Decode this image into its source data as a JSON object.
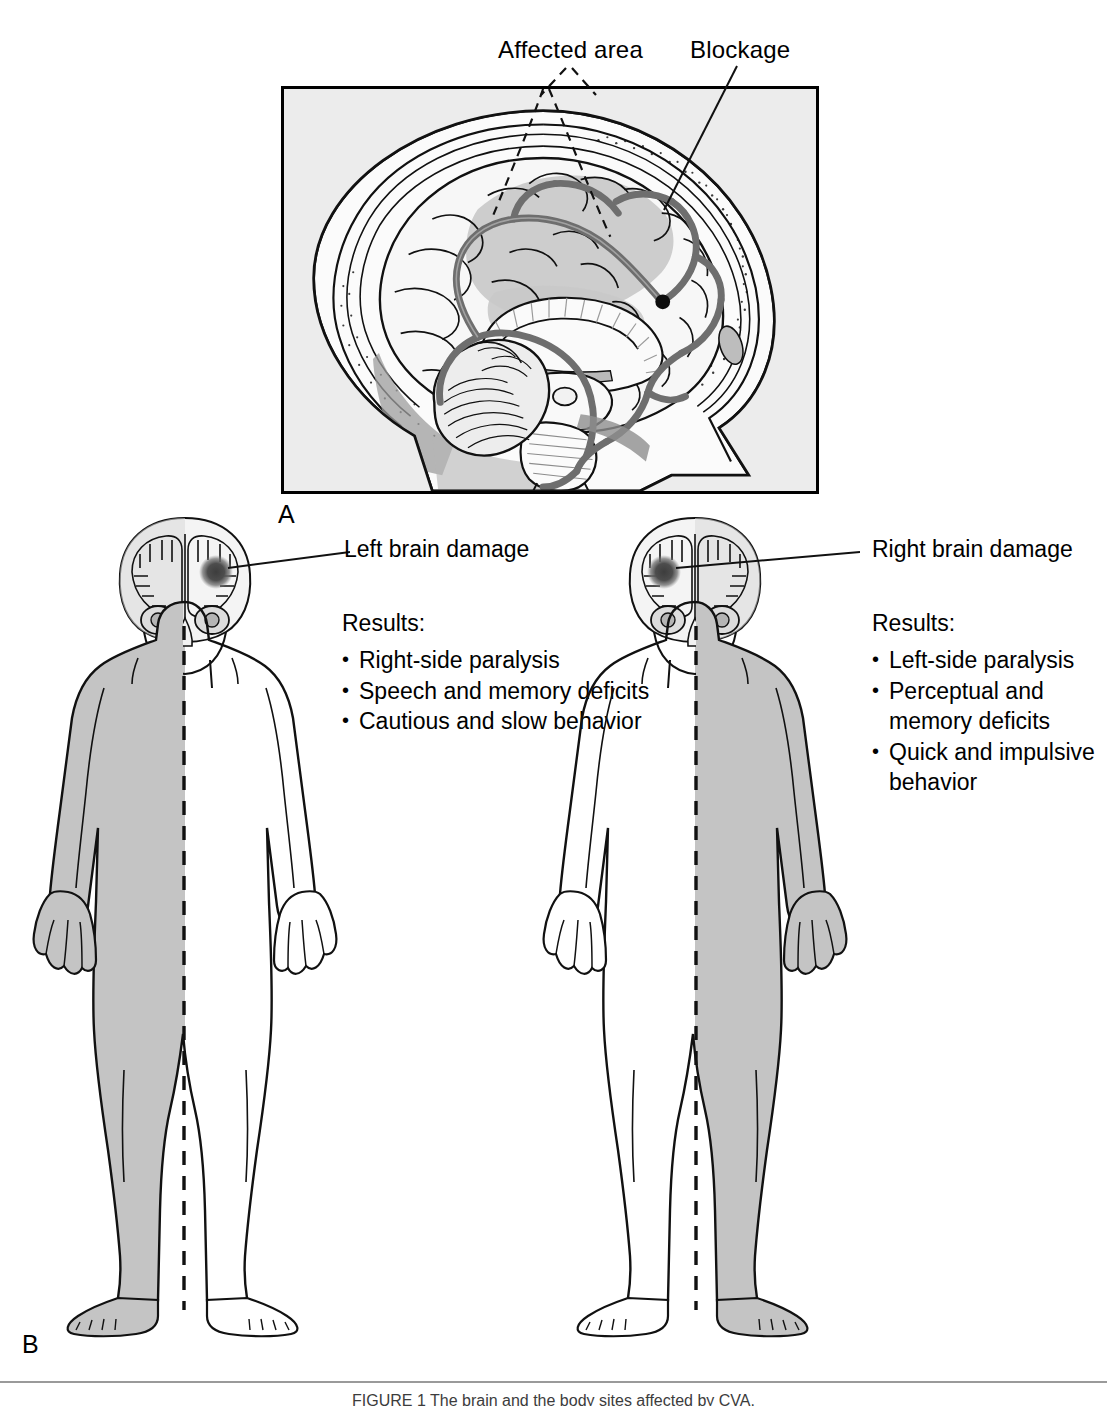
{
  "figure": {
    "panel_a_letter": "A",
    "panel_b_letter": "B",
    "footer_caption": "FIGURE 1  The brain and the body sites affected by CVA."
  },
  "panel_a": {
    "labels": {
      "affected_area": "Affected area",
      "blockage": "Blockage"
    },
    "background_color": "#ececec",
    "vessel_color": "#6e6e6e",
    "tissue_shade_color": "#cfcfcf",
    "anatomy_icons": [
      "brain-sagittal-section-icon",
      "cerebral-artery-icon",
      "corpus-callosum-icon",
      "cerebellum-icon",
      "brainstem-icon",
      "skull-icon",
      "blockage-occlusion-dot-icon"
    ]
  },
  "panel_b": {
    "body_shade_color": "#c4c4c4",
    "lesion_color": "#4a4a4a",
    "figures": [
      {
        "id": "left-brain-damage",
        "callout": "Left brain damage",
        "results_title": "Results:",
        "results": [
          "Right-side paralysis",
          "Speech and memory deficits",
          "Cautious and slow behavior"
        ],
        "lesion_hemisphere": "left",
        "lesion_side_on_screen": "right",
        "shaded_body_side_on_screen": "left"
      },
      {
        "id": "right-brain-damage",
        "callout": "Right brain damage",
        "results_title": "Results:",
        "results": [
          "Left-side paralysis",
          "Perceptual and",
          "memory deficits",
          "Quick and impulsive",
          "behavior"
        ],
        "results_bulleted": [
          true,
          true,
          false,
          true,
          false
        ],
        "lesion_hemisphere": "right",
        "lesion_side_on_screen": "left",
        "shaded_body_side_on_screen": "right"
      }
    ]
  }
}
